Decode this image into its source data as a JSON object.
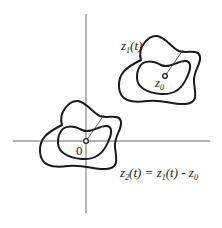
{
  "diagram": {
    "type": "complex-plane-translation",
    "axes": {
      "x_axis": {
        "from": [
          13,
          141
        ],
        "to": [
          210,
          141
        ]
      },
      "y_axis": {
        "from": [
          86,
          14
        ],
        "to": [
          86,
          213
        ]
      }
    },
    "labels": {
      "z1_curve": {
        "base": "z",
        "sub": "1",
        "arg": "(t)"
      },
      "z0_point": {
        "base": "z",
        "sub": "0"
      },
      "origin": "0",
      "z2_eq": {
        "lhs_base": "z",
        "lhs_sub": "2",
        "lhs_arg": "(t)",
        "eq": " = ",
        "rhs1_base": "z",
        "rhs1_sub": "1",
        "rhs1_arg": "(t)",
        "minus": " - ",
        "rhs2_base": "z",
        "rhs2_sub": "0"
      }
    },
    "shapes": [
      {
        "name": "z1-outer-curve",
        "center": [
          165,
          76
        ]
      },
      {
        "name": "z1-inner-curve",
        "center": [
          165,
          76
        ]
      },
      {
        "name": "z2-outer-curve",
        "center": [
          86,
          141
        ]
      },
      {
        "name": "z2-inner-curve",
        "center": [
          86,
          141
        ]
      }
    ],
    "colors": {
      "stroke": "#1a1a1a",
      "axis": "#6a6a6a",
      "background": "#ffffff"
    }
  }
}
